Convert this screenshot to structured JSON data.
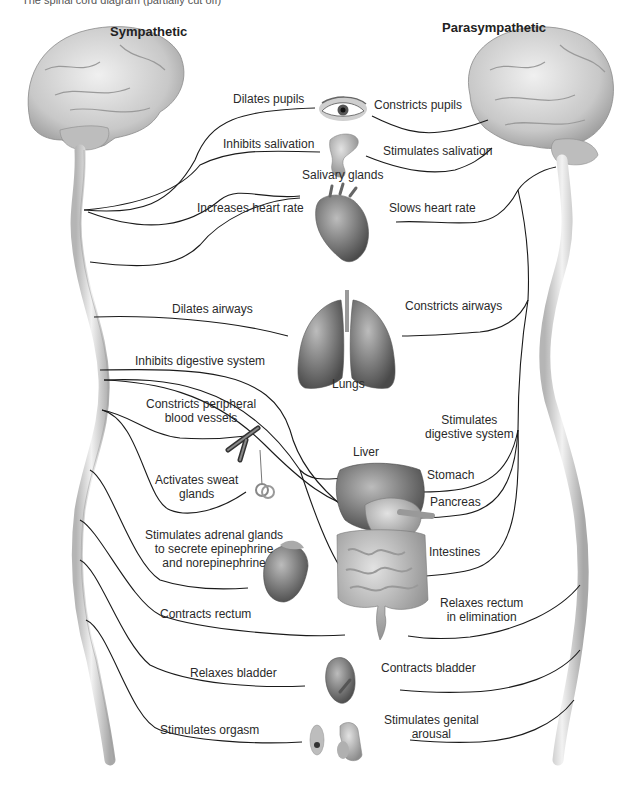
{
  "caption_fragment": "The spinal cord diagram (partially cut off)",
  "headers": {
    "sympathetic": "Sympathetic",
    "parasympathetic": "Parasympathetic"
  },
  "organs": {
    "eye": "",
    "salivary": "Salivary glands",
    "lungs": "Lungs",
    "liver": "Liver",
    "stomach": "Stomach",
    "pancreas": "Pancreas",
    "intestines": "Intestines"
  },
  "sympathetic_effects": {
    "pupils": "Dilates pupils",
    "salivation": "Inhibits salivation",
    "heart": "Increases heart rate",
    "airways": "Dilates airways",
    "digestive": "Inhibits digestive system",
    "vessels_1": "Constricts peripheral",
    "vessels_2": "blood vessels",
    "sweat_1": "Activates sweat",
    "sweat_2": "glands",
    "adrenal_1": "Stimulates adrenal glands",
    "adrenal_2": "to secrete epinephrine",
    "adrenal_3": "and norepinephrine",
    "rectum": "Contracts rectum",
    "bladder": "Relaxes bladder",
    "orgasm": "Stimulates orgasm"
  },
  "parasympathetic_effects": {
    "pupils": "Constricts pupils",
    "salivation": "Stimulates salivation",
    "heart": "Slows heart rate",
    "airways": "Constricts airways",
    "digestive_1": "Stimulates",
    "digestive_2": "digestive system",
    "rectum_1": "Relaxes rectum",
    "rectum_2": "in elimination",
    "bladder": "Contracts bladder",
    "genital_1": "Stimulates genital",
    "genital_2": "arousal"
  },
  "colors": {
    "nerve": "#1a1a1a",
    "brain": "#cfcfcf",
    "cord": "#d6d6d6",
    "organ_dark": "#555555",
    "organ_mid": "#8a8a8a",
    "organ_light": "#bdbdbd"
  }
}
